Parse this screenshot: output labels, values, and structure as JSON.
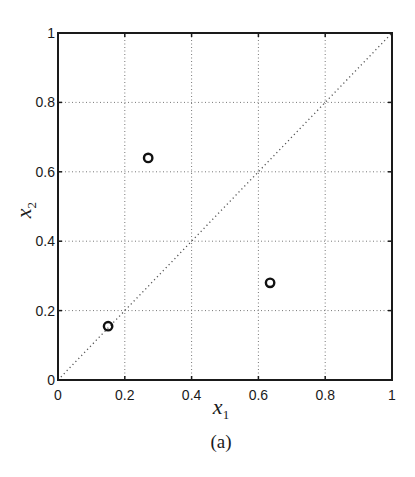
{
  "figure": {
    "caption": "(a)"
  },
  "chart_data": {
    "type": "scatter",
    "title": "",
    "xlabel": "x1",
    "ylabel": "x2",
    "xlim": [
      0,
      1
    ],
    "ylim": [
      0,
      1
    ],
    "grid": true,
    "grid_style": "dotted",
    "x_ticks": [
      0,
      0.2,
      0.4,
      0.6,
      0.8,
      1
    ],
    "y_ticks": [
      0,
      0.2,
      0.4,
      0.6,
      0.8,
      1
    ],
    "x_tick_labels": [
      "0",
      "0.2",
      "0.4",
      "0.6",
      "0.8",
      "1"
    ],
    "y_tick_labels": [
      "0",
      "0.2",
      "0.4",
      "0.6",
      "0.8",
      "1"
    ],
    "reference_line": {
      "type": "diagonal",
      "from": [
        0,
        0
      ],
      "to": [
        1,
        1
      ],
      "style": "dotted"
    },
    "series": [
      {
        "name": "points",
        "marker": "open-circle",
        "x": [
          0.27,
          0.15,
          0.635
        ],
        "y": [
          0.64,
          0.155,
          0.28
        ]
      }
    ],
    "legend": null
  }
}
